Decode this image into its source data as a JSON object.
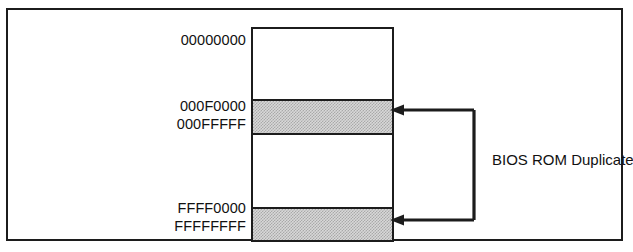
{
  "figure": {
    "type": "memory-map-diagram",
    "background_color": "#ffffff",
    "line_color": "#1c1c1c",
    "shade_color": "#d8d8d8"
  },
  "memory_map": {
    "addresses": {
      "top": "00000000",
      "low_rom_start": "000F0000",
      "low_rom_end": "000FFFFF",
      "high_rom_start": "FFFF0000",
      "high_rom_end": "FFFFFFFF"
    },
    "regions": [
      {
        "name": "low-ram",
        "shaded": false,
        "start": "00000000",
        "end": "000EFFFF"
      },
      {
        "name": "low-rom",
        "shaded": true,
        "start": "000F0000",
        "end": "000FFFFF"
      },
      {
        "name": "mid-ram",
        "shaded": false,
        "start": "00100000",
        "end": "FFFEFFFF"
      },
      {
        "name": "high-rom",
        "shaded": true,
        "start": "FFFF0000",
        "end": "FFFFFFFF"
      }
    ]
  },
  "annotation": {
    "label": "BIOS ROM Duplicate",
    "points_to": [
      "low-rom",
      "high-rom"
    ],
    "arrow_direction": "left"
  }
}
